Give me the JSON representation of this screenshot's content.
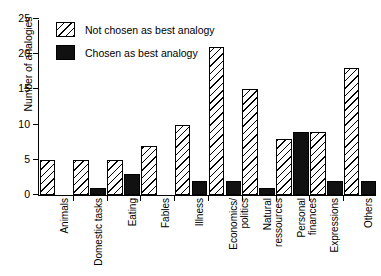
{
  "chart_data": {
    "type": "bar",
    "title": "",
    "xlabel": "",
    "ylabel": "Number of analogies",
    "ylim": [
      0,
      25
    ],
    "yticks": [
      0,
      5,
      10,
      15,
      20,
      25
    ],
    "grid": false,
    "legend_position": "upper-left-inside",
    "categories": [
      "Animals",
      "Domestic tasks",
      "Eating",
      "Fables",
      "Illness",
      "Economics/\npolitics",
      "Natural\nressources",
      "Personal\nfinances",
      "Expressions",
      "Others"
    ],
    "series": [
      {
        "name": "Not chosen as best analogy",
        "pattern": "diagonal-hatch",
        "color": "#ffffff",
        "values": [
          5,
          5,
          5,
          7,
          10,
          21,
          15,
          8,
          9,
          18
        ]
      },
      {
        "name": "Chosen as best analogy",
        "pattern": "solid",
        "color": "#111111",
        "values": [
          0,
          1,
          3,
          0,
          2,
          2,
          1,
          9,
          2,
          2
        ]
      }
    ]
  },
  "legend": {
    "items": [
      {
        "label": "Not chosen as best analogy"
      },
      {
        "label": "Chosen as best analogy"
      }
    ]
  }
}
